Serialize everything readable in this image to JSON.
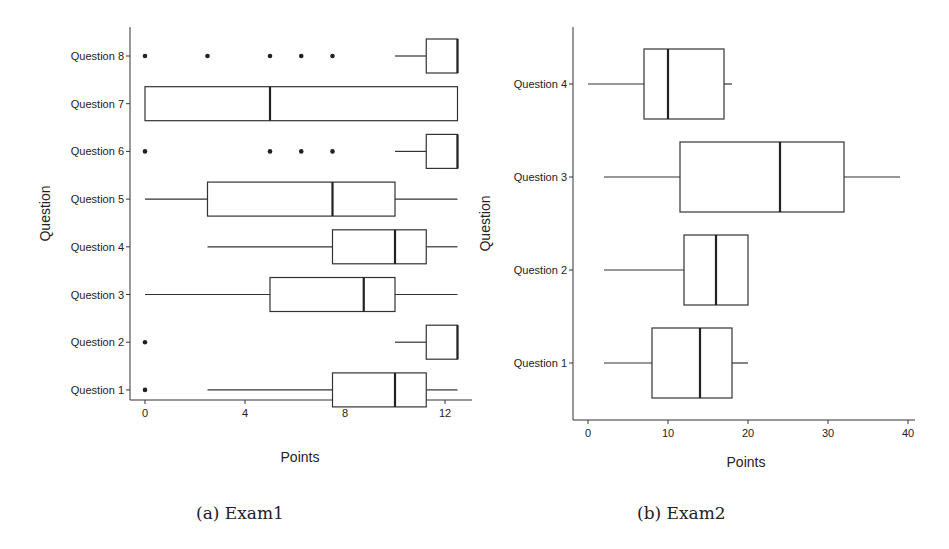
{
  "figure": {
    "captions": [
      "(a) Exam1",
      "(b) Exam2"
    ]
  },
  "chart_data": [
    {
      "type": "boxplot",
      "orientation": "horizontal",
      "title": "",
      "caption": "(a) Exam1",
      "xlabel": "Points",
      "ylabel": "Question",
      "xlim": [
        -0.5,
        13.1
      ],
      "xticks": [
        0,
        4,
        8,
        12
      ],
      "categories": [
        "Question 1",
        "Question 2",
        "Question 3",
        "Question 4",
        "Question 5",
        "Question 6",
        "Question 7",
        "Question 8"
      ],
      "series": [
        {
          "name": "Question 1",
          "whisker_low": 2.5,
          "q1": 7.5,
          "median": 10,
          "q3": 11.25,
          "whisker_high": 12.5,
          "outliers": [
            0
          ]
        },
        {
          "name": "Question 2",
          "whisker_low": 10,
          "q1": 11.25,
          "median": 12.5,
          "q3": 12.5,
          "whisker_high": 12.5,
          "outliers": [
            0
          ]
        },
        {
          "name": "Question 3",
          "whisker_low": 0,
          "q1": 5,
          "median": 8.75,
          "q3": 10,
          "whisker_high": 12.5,
          "outliers": []
        },
        {
          "name": "Question 4",
          "whisker_low": 2.5,
          "q1": 7.5,
          "median": 10,
          "q3": 11.25,
          "whisker_high": 12.5,
          "outliers": []
        },
        {
          "name": "Question 5",
          "whisker_low": 0,
          "q1": 2.5,
          "median": 7.5,
          "q3": 10,
          "whisker_high": 12.5,
          "outliers": []
        },
        {
          "name": "Question 6",
          "whisker_low": 10,
          "q1": 11.25,
          "median": 12.5,
          "q3": 12.5,
          "whisker_high": 12.5,
          "outliers": [
            0,
            5,
            6.25,
            7.5
          ]
        },
        {
          "name": "Question 7",
          "whisker_low": 0,
          "q1": 0,
          "median": 5,
          "q3": 12.5,
          "whisker_high": 12.5,
          "outliers": []
        },
        {
          "name": "Question 8",
          "whisker_low": 10,
          "q1": 11.25,
          "median": 12.5,
          "q3": 12.5,
          "whisker_high": 12.5,
          "outliers": [
            0,
            2.5,
            5,
            6.25,
            7.5
          ]
        }
      ],
      "grid": false,
      "legend": null
    },
    {
      "type": "boxplot",
      "orientation": "horizontal",
      "title": "",
      "caption": "(b) Exam2",
      "xlabel": "Points",
      "ylabel": "Question",
      "xlim": [
        -2,
        41
      ],
      "xticks": [
        0,
        10,
        20,
        30,
        40
      ],
      "categories": [
        "Question 1",
        "Question 2",
        "Question 3",
        "Question 4"
      ],
      "series": [
        {
          "name": "Question 1",
          "whisker_low": 2,
          "q1": 8,
          "median": 14,
          "q3": 18,
          "whisker_high": 20,
          "outliers": []
        },
        {
          "name": "Question 2",
          "whisker_low": 2,
          "q1": 12,
          "median": 16,
          "q3": 20,
          "whisker_high": 20,
          "outliers": []
        },
        {
          "name": "Question 3",
          "whisker_low": 2,
          "q1": 11.5,
          "median": 24,
          "q3": 32,
          "whisker_high": 39,
          "outliers": []
        },
        {
          "name": "Question 4",
          "whisker_low": 0,
          "q1": 7,
          "median": 10,
          "q3": 17,
          "whisker_high": 18,
          "outliers": []
        }
      ],
      "grid": false,
      "legend": null
    }
  ]
}
